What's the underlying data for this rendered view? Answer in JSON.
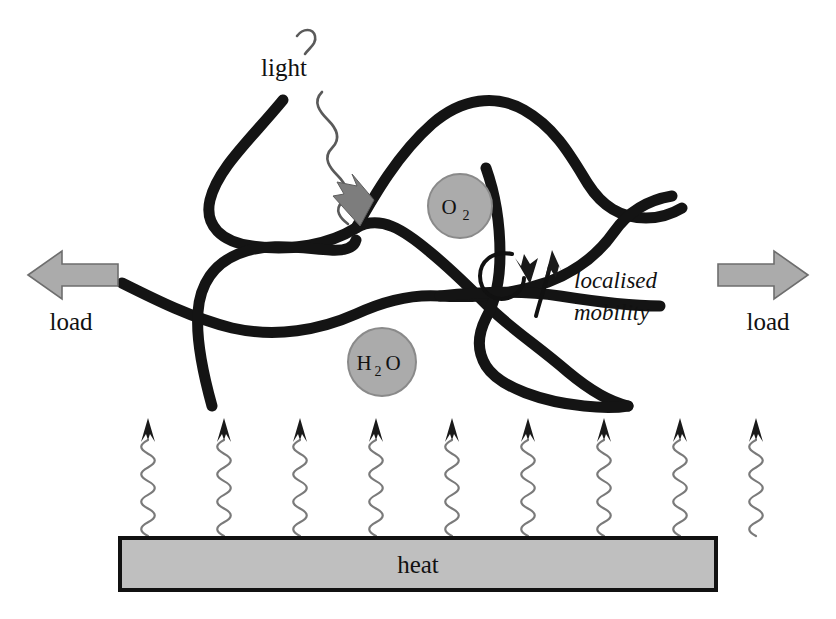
{
  "figure": {
    "background_color": "#ffffff"
  },
  "labels": {
    "light": "light",
    "heat": "heat",
    "load_left": "load",
    "load_right": "load",
    "localised_mobility_line1": "localised",
    "localised_mobility_line2": "mobility"
  },
  "molecules": [
    {
      "id": "oxygen",
      "formula_main": "O",
      "formula_sub": "2",
      "cx": 460,
      "cy": 206,
      "r": 32
    },
    {
      "id": "water",
      "formula_main": "H",
      "formula_sub": "2",
      "formula_tail": "O",
      "cx": 382,
      "cy": 362,
      "r": 34
    }
  ],
  "colors": {
    "chain": "#141414",
    "molecule_fill": "#ababab",
    "molecule_stroke": "#8a8a8a",
    "heat_bar_fill": "#bfbfbf",
    "heat_bar_stroke": "#111111",
    "load_arrow_fill": "#ababab",
    "load_arrow_stroke": "#6e6e6e",
    "squiggle": "#7a7a7a",
    "light_arrowhead": "#7d7d7d"
  },
  "heat_source": {
    "bar_x": 120,
    "bar_y": 538,
    "bar_width": 596,
    "bar_height": 52,
    "arrow_count": 9,
    "arrow_first_x": 148,
    "arrow_spacing": 76,
    "arrow_top_y": 418,
    "arrow_bottom_y": 536
  },
  "load_arrows": [
    {
      "id": "load-left",
      "direction": "left",
      "x": 28,
      "y": 252,
      "width": 92,
      "height": 46
    },
    {
      "id": "load-right",
      "direction": "right",
      "x": 716,
      "y": 252,
      "width": 92,
      "height": 46
    }
  ],
  "annotations": {
    "light_squiggle_top_x": 302,
    "light_squiggle_top_y": 30,
    "light_arrow_tip_x": 360,
    "light_arrow_tip_y": 222,
    "rotation_arrow_cx": 508,
    "rotation_arrow_cy": 272
  },
  "chart_data": {
    "type": "diagram"
  }
}
